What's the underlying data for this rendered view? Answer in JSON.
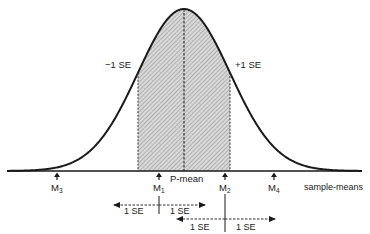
{
  "diagram": {
    "type": "normal-distribution-sampling",
    "curve": {
      "center_label": "P-mean",
      "left_band_label": "−1 SE",
      "right_band_label": "+1 SE",
      "shaded_region": "between −1 SE and +1 SE"
    },
    "axis": {
      "label": "sample-means"
    },
    "markers": [
      {
        "id": "M3",
        "base": "M",
        "sub": "3"
      },
      {
        "id": "M1",
        "base": "M",
        "sub": "1"
      },
      {
        "id": "M2",
        "base": "M",
        "sub": "2"
      },
      {
        "id": "M4",
        "base": "M",
        "sub": "4"
      }
    ],
    "intervals": [
      {
        "around": "M1",
        "left_label": "1 SE",
        "right_label": "1 SE"
      },
      {
        "around": "M2",
        "left_label": "1 SE",
        "right_label": "1 SE"
      }
    ]
  },
  "colors": {
    "ink": "#1a1a1a",
    "shade_bg": "#d8d8d8",
    "hatch": "#8a8a8a",
    "background": "#ffffff"
  }
}
